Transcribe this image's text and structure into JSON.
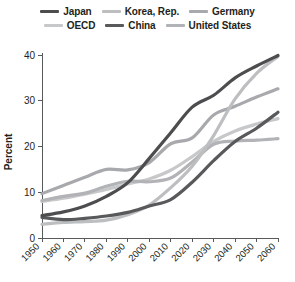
{
  "chart_data": {
    "type": "line",
    "title": "",
    "xlabel": "",
    "ylabel": "Percent",
    "xlim": [
      1950,
      2060
    ],
    "ylim": [
      0,
      40
    ],
    "ytick_labels": [
      "0",
      "10",
      "20",
      "30",
      "40"
    ],
    "yticks": [
      0,
      10,
      20,
      30,
      40
    ],
    "xtick_labels": [
      "1950",
      "1960",
      "1970",
      "1980",
      "1990",
      "2000",
      "2010",
      "2020",
      "2030",
      "2040",
      "2050",
      "2060"
    ],
    "xticks": [
      1950,
      1960,
      1970,
      1980,
      1990,
      2000,
      2010,
      2020,
      2030,
      2040,
      2050,
      2060
    ],
    "grid": false,
    "legend_position": "top",
    "x": [
      1950,
      1960,
      1970,
      1980,
      1990,
      2000,
      2010,
      2020,
      2030,
      2040,
      2050,
      2060
    ],
    "series": [
      {
        "name": "Japan",
        "color": "#4d4d4f",
        "width": 3.2,
        "values": [
          4.9,
          5.7,
          7.0,
          9.1,
          12.1,
          17.4,
          23.0,
          28.6,
          31.2,
          35.0,
          37.6,
          39.9
        ]
      },
      {
        "name": "OECD",
        "color": "#c7c8ca",
        "width": 3.2,
        "values": [
          8.0,
          8.7,
          9.6,
          10.6,
          11.8,
          12.9,
          14.8,
          17.8,
          21.1,
          23.4,
          24.9,
          26.1
        ]
      },
      {
        "name": "Korea, Rep.",
        "color": "#bcbec0",
        "width": 3.2,
        "values": [
          3.0,
          3.4,
          3.6,
          3.9,
          5.1,
          7.2,
          11.0,
          15.7,
          22.4,
          30.4,
          36.0,
          39.7
        ]
      },
      {
        "name": "China",
        "color": "#58595b",
        "width": 3.2,
        "values": [
          4.5,
          4.0,
          4.3,
          4.8,
          5.6,
          7.0,
          8.4,
          12.2,
          16.9,
          21.1,
          24.0,
          27.5
        ]
      },
      {
        "name": "Germany",
        "color": "#a7a9ac",
        "width": 3.2,
        "values": [
          9.7,
          11.5,
          13.3,
          15.0,
          14.9,
          16.5,
          20.6,
          21.9,
          26.9,
          28.8,
          30.8,
          32.6
        ]
      },
      {
        "name": "United States",
        "color": "#b1b3b6",
        "width": 3.2,
        "values": [
          8.2,
          9.1,
          9.8,
          11.3,
          12.4,
          12.3,
          13.1,
          16.6,
          20.5,
          21.2,
          21.4,
          21.7
        ]
      }
    ]
  },
  "legend": {
    "rows": [
      [
        {
          "label": "Japan",
          "color": "#4d4d4f"
        },
        {
          "label": "Korea, Rep.",
          "color": "#bcbec0"
        },
        {
          "label": "Germany",
          "color": "#a7a9ac"
        }
      ],
      [
        {
          "label": "OECD",
          "color": "#c7c8ca"
        },
        {
          "label": "China",
          "color": "#58595b"
        },
        {
          "label": "United States",
          "color": "#b1b3b6"
        }
      ]
    ]
  },
  "axes": {
    "y_title": "Percent"
  }
}
